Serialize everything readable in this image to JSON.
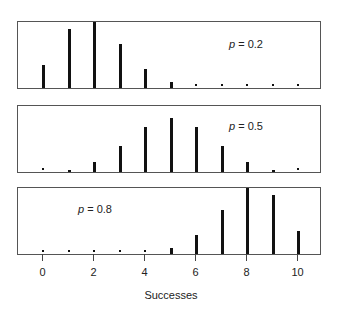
{
  "chart_data": [
    {
      "type": "bar",
      "title": "p = 0.2",
      "annotation": "p = 0.2",
      "x": [
        0,
        1,
        2,
        3,
        4,
        5,
        6,
        7,
        8,
        9,
        10
      ],
      "values": [
        0.107,
        0.268,
        0.302,
        0.201,
        0.088,
        0.026,
        0.006,
        0.001,
        0.0,
        0.0,
        0.0
      ],
      "xlabel": "",
      "ylabel": "",
      "grid": false
    },
    {
      "type": "bar",
      "title": "p = 0.5",
      "annotation": "p = 0.5",
      "x": [
        0,
        1,
        2,
        3,
        4,
        5,
        6,
        7,
        8,
        9,
        10
      ],
      "values": [
        0.001,
        0.01,
        0.044,
        0.117,
        0.205,
        0.246,
        0.205,
        0.117,
        0.044,
        0.01,
        0.001
      ],
      "xlabel": "",
      "ylabel": "",
      "grid": false
    },
    {
      "type": "bar",
      "title": "p = 0.8",
      "annotation": "p = 0.8",
      "x": [
        0,
        1,
        2,
        3,
        4,
        5,
        6,
        7,
        8,
        9,
        10
      ],
      "values": [
        0.0,
        0.0,
        0.0,
        0.001,
        0.006,
        0.026,
        0.088,
        0.201,
        0.302,
        0.268,
        0.107
      ],
      "xlabel": "Successes",
      "ylabel": "",
      "grid": false,
      "xticks": [
        0,
        2,
        4,
        6,
        8,
        10
      ]
    }
  ],
  "panels": [
    {
      "p_symbol": "p",
      "p_text": " = 0.2"
    },
    {
      "p_symbol": "p",
      "p_text": " = 0.5"
    },
    {
      "p_symbol": "p",
      "p_text": " = 0.8"
    }
  ],
  "axis": {
    "xlabel": "Successes",
    "ticks": [
      "0",
      "2",
      "4",
      "6",
      "8",
      "10"
    ]
  }
}
